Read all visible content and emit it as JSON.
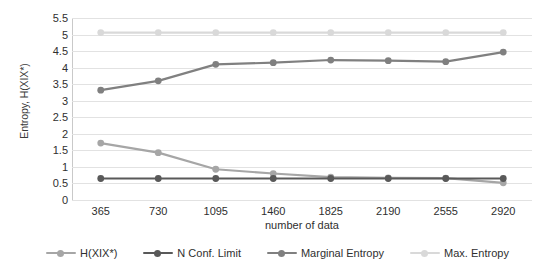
{
  "chart_data": {
    "type": "line",
    "title": "",
    "xlabel": "number of data",
    "ylabel": "Entropy, H(XIX*)",
    "categories": [
      "365",
      "730",
      "1095",
      "1460",
      "1825",
      "2190",
      "2555",
      "2920"
    ],
    "ylim": [
      0,
      5.5
    ],
    "yticks": [
      "0",
      "0.5",
      "1",
      "1.5",
      "2",
      "2.5",
      "3",
      "3.5",
      "4",
      "4.5",
      "5",
      "5.5"
    ],
    "grid": true,
    "legend_position": "bottom",
    "series": [
      {
        "name": "H(XIX*)",
        "color": "#a6a6a6",
        "values": [
          1.72,
          1.43,
          0.93,
          0.8,
          0.69,
          0.67,
          0.66,
          0.52
        ]
      },
      {
        "name": "N Conf. Limit",
        "color": "#595959",
        "values": [
          0.65,
          0.65,
          0.65,
          0.65,
          0.65,
          0.65,
          0.65,
          0.65
        ]
      },
      {
        "name": "Marginal Entropy",
        "color": "#808080",
        "values": [
          3.32,
          3.6,
          4.1,
          4.15,
          4.23,
          4.21,
          4.18,
          4.47
        ]
      },
      {
        "name": "Max. Entropy",
        "color": "#d9d9d9",
        "values": [
          5.06,
          5.06,
          5.06,
          5.06,
          5.06,
          5.06,
          5.06,
          5.06
        ]
      }
    ]
  },
  "legend": {
    "items": [
      {
        "label": "H(XIX*)"
      },
      {
        "label": "N Conf. Limit"
      },
      {
        "label": "Marginal Entropy"
      },
      {
        "label": "Max. Entropy"
      }
    ]
  }
}
